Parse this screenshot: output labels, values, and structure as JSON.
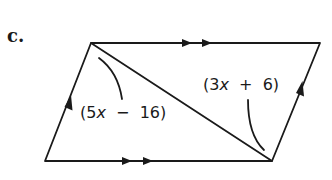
{
  "part": {
    "label": "c."
  },
  "figure": {
    "type": "parallelogram",
    "vertices": {
      "top_left": [
        91,
        43
      ],
      "top_right": [
        320,
        43
      ],
      "bottom_right": [
        272,
        161
      ],
      "bottom_left": [
        45,
        161
      ]
    },
    "diagonal": {
      "from": "top_left",
      "to": "bottom_right"
    },
    "markings": {
      "top_side": "double-arrow",
      "bottom_side": "double-arrow",
      "left_side": "single-arrow",
      "right_side": "single-arrow"
    },
    "stroke_color": "#1a1a1a"
  },
  "angles": {
    "left": {
      "coef": "5",
      "var": "x",
      "op": "−",
      "const": "16",
      "text": "(5x − 16)"
    },
    "right": {
      "coef": "3",
      "var": "x",
      "op": "+",
      "const": "6",
      "text": "(3x + 6)"
    }
  }
}
